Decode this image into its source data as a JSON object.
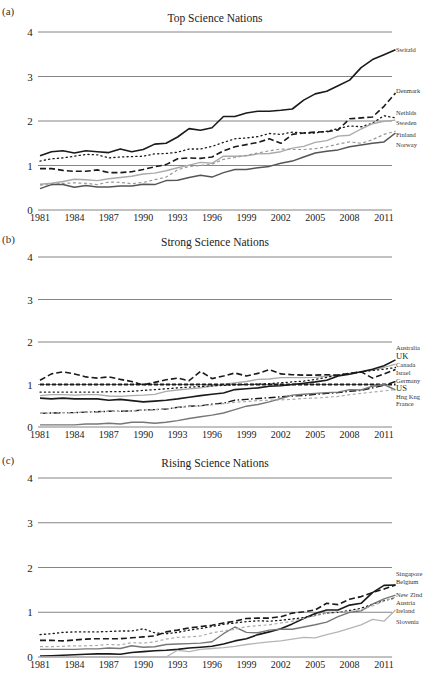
{
  "figure": {
    "panels": [
      {
        "id": "a",
        "label": "(a)",
        "title": "Top Science Nations"
      },
      {
        "id": "b",
        "label": "(b)",
        "title": "Strong Science Nations"
      },
      {
        "id": "c",
        "label": "(c)",
        "title": "Rising Science Nations"
      }
    ]
  },
  "chart_data": [
    {
      "type": "line",
      "panel_label": "(a)",
      "title": "Top Science Nations",
      "xlabel": "",
      "ylabel": "",
      "ylim": [
        0,
        4
      ],
      "yticks": [
        0,
        1,
        2,
        3,
        4
      ],
      "xticks": [
        "1981",
        "1984",
        "1987",
        "1990",
        "1993",
        "1996",
        "1999",
        "2002",
        "2005",
        "2008",
        "2011"
      ],
      "x": [
        1981,
        1982,
        1983,
        1984,
        1985,
        1986,
        1987,
        1988,
        1989,
        1990,
        1991,
        1992,
        1993,
        1994,
        1995,
        1996,
        1997,
        1998,
        1999,
        2000,
        2001,
        2002,
        2003,
        2004,
        2005,
        2006,
        2007,
        2008,
        2009,
        2010,
        2011,
        2012
      ],
      "grid": true,
      "legend": "inline-right",
      "series": [
        {
          "name": "Switzld",
          "style": "solid",
          "color": "#1a1a1a",
          "width": 1.6,
          "values": [
            1.22,
            1.31,
            1.33,
            1.28,
            1.33,
            1.31,
            1.29,
            1.37,
            1.31,
            1.36,
            1.48,
            1.5,
            1.64,
            1.83,
            1.79,
            1.85,
            2.1,
            2.1,
            2.18,
            2.22,
            2.22,
            2.24,
            2.27,
            2.47,
            2.61,
            2.67,
            2.79,
            2.92,
            3.2,
            3.38,
            3.49,
            3.6
          ]
        },
        {
          "name": "Denmark",
          "style": "dashed",
          "color": "#1a1a1a",
          "width": 1.6,
          "values": [
            0.93,
            0.93,
            0.89,
            0.87,
            0.87,
            0.9,
            0.84,
            0.84,
            0.86,
            0.91,
            0.97,
            1.02,
            1.15,
            1.17,
            1.16,
            1.19,
            1.33,
            1.42,
            1.47,
            1.52,
            1.6,
            1.5,
            1.7,
            1.73,
            1.75,
            1.76,
            1.8,
            2.05,
            2.07,
            2.09,
            2.33,
            2.63
          ]
        },
        {
          "name": "Nethlds",
          "style": "dotted",
          "color": "#1a1a1a",
          "width": 1.3,
          "values": [
            1.1,
            1.15,
            1.17,
            1.21,
            1.25,
            1.24,
            1.17,
            1.19,
            1.2,
            1.21,
            1.26,
            1.27,
            1.3,
            1.37,
            1.37,
            1.43,
            1.52,
            1.6,
            1.62,
            1.65,
            1.72,
            1.7,
            1.75,
            1.73,
            1.73,
            1.77,
            1.83,
            1.89,
            1.87,
            1.95,
            2.12,
            2.07
          ]
        },
        {
          "name": "Sweden",
          "style": "solid",
          "color": "#aaaaaa",
          "width": 1.4,
          "values": [
            0.58,
            0.6,
            0.64,
            0.69,
            0.68,
            0.66,
            0.7,
            0.73,
            0.76,
            0.81,
            0.83,
            0.88,
            0.95,
            1.01,
            1.07,
            1.05,
            1.21,
            1.21,
            1.22,
            1.26,
            1.27,
            1.31,
            1.39,
            1.43,
            1.52,
            1.56,
            1.66,
            1.68,
            1.82,
            1.94,
            1.99,
            2.02
          ]
        },
        {
          "name": "Finland",
          "style": "dashed-fine",
          "color": "#999999",
          "width": 1.2,
          "values": [
            0.56,
            0.57,
            0.6,
            0.61,
            0.6,
            0.57,
            0.63,
            0.62,
            0.59,
            0.62,
            0.68,
            0.74,
            0.9,
            0.98,
            1.0,
            1.03,
            1.14,
            1.18,
            1.23,
            1.28,
            1.33,
            1.37,
            1.36,
            1.36,
            1.38,
            1.42,
            1.48,
            1.53,
            1.5,
            1.58,
            1.7,
            1.77
          ]
        },
        {
          "name": "Norway",
          "style": "solid",
          "color": "#555555",
          "width": 1.5,
          "values": [
            0.48,
            0.57,
            0.57,
            0.51,
            0.55,
            0.52,
            0.52,
            0.54,
            0.54,
            0.58,
            0.57,
            0.66,
            0.67,
            0.73,
            0.78,
            0.74,
            0.84,
            0.91,
            0.91,
            0.95,
            0.98,
            1.05,
            1.1,
            1.19,
            1.28,
            1.32,
            1.35,
            1.42,
            1.46,
            1.5,
            1.53,
            1.73
          ]
        }
      ]
    },
    {
      "type": "line",
      "panel_label": "(b)",
      "title": "Strong Science Nations",
      "xlabel": "",
      "ylabel": "",
      "ylim": [
        0,
        4
      ],
      "yticks": [
        0,
        1,
        2,
        3,
        4
      ],
      "xticks": [
        "1981",
        "1984",
        "1987",
        "1990",
        "1993",
        "1996",
        "1999",
        "2002",
        "2005",
        "2008",
        "2011"
      ],
      "x": [
        1981,
        1982,
        1983,
        1984,
        1985,
        1986,
        1987,
        1988,
        1989,
        1990,
        1991,
        1992,
        1993,
        1994,
        1995,
        1996,
        1997,
        1998,
        1999,
        2000,
        2001,
        2002,
        2003,
        2004,
        2005,
        2006,
        2007,
        2008,
        2009,
        2010,
        2011,
        2012
      ],
      "grid": true,
      "legend": "inline-right",
      "series": [
        {
          "name": "Australia",
          "style": "solid",
          "color": "#aaaaaa",
          "width": 1.3,
          "values": [
            0.74,
            0.76,
            0.76,
            0.75,
            0.76,
            0.76,
            0.73,
            0.72,
            0.74,
            0.75,
            0.77,
            0.84,
            0.87,
            0.9,
            0.92,
            0.96,
            1.0,
            1.04,
            1.07,
            1.12,
            1.13,
            1.16,
            1.16,
            1.16,
            1.17,
            1.2,
            1.22,
            1.26,
            1.3,
            1.34,
            1.4,
            1.48
          ]
        },
        {
          "name": "UK",
          "style": "solid",
          "color": "#1a1a1a",
          "width": 1.6,
          "values": [
            0.68,
            0.66,
            0.68,
            0.66,
            0.66,
            0.66,
            0.63,
            0.65,
            0.62,
            0.59,
            0.61,
            0.63,
            0.66,
            0.7,
            0.74,
            0.77,
            0.8,
            0.88,
            0.9,
            0.92,
            0.96,
            0.97,
            1.0,
            1.03,
            1.06,
            1.1,
            1.2,
            1.24,
            1.3,
            1.36,
            1.44,
            1.58
          ]
        },
        {
          "name": "Canada",
          "style": "dotted",
          "color": "#1a1a1a",
          "width": 1.3,
          "values": [
            0.82,
            0.82,
            0.82,
            0.82,
            0.82,
            0.82,
            0.83,
            0.83,
            0.84,
            0.86,
            0.88,
            0.9,
            0.92,
            0.94,
            0.95,
            0.97,
            0.98,
            0.99,
            1.0,
            1.01,
            1.02,
            1.04,
            1.06,
            1.08,
            1.12,
            1.17,
            1.22,
            1.26,
            1.3,
            1.33,
            1.36,
            1.4
          ]
        },
        {
          "name": "Israel",
          "style": "dashed",
          "color": "#1a1a1a",
          "width": 1.6,
          "values": [
            1.1,
            1.25,
            1.3,
            1.25,
            1.18,
            1.15,
            1.18,
            1.12,
            1.07,
            0.99,
            1.05,
            1.11,
            1.15,
            1.09,
            1.31,
            1.14,
            1.2,
            1.27,
            1.2,
            1.26,
            1.35,
            1.25,
            1.23,
            1.22,
            1.22,
            1.23,
            1.22,
            1.26,
            1.3,
            1.15,
            1.25,
            1.35
          ]
        },
        {
          "name": "Germany",
          "style": "dashdot",
          "color": "#1a1a1a",
          "width": 1.4,
          "values": [
            0.32,
            0.33,
            0.34,
            0.34,
            0.35,
            0.36,
            0.37,
            0.37,
            0.38,
            0.4,
            0.41,
            0.42,
            0.46,
            0.49,
            0.5,
            0.54,
            0.56,
            0.63,
            0.65,
            0.67,
            0.69,
            0.71,
            0.73,
            0.74,
            0.77,
            0.79,
            0.81,
            0.84,
            0.86,
            0.92,
            0.98,
            1.07
          ]
        },
        {
          "name": "US",
          "style": "dashed-short",
          "color": "#1a1a1a",
          "width": 1.8,
          "values": [
            1.0,
            1.0,
            1.0,
            1.0,
            1.0,
            1.0,
            1.0,
            1.0,
            1.0,
            1.0,
            1.0,
            1.0,
            1.0,
            1.0,
            1.0,
            1.0,
            1.0,
            1.0,
            1.0,
            1.0,
            1.0,
            1.0,
            1.0,
            1.0,
            1.0,
            1.0,
            1.0,
            1.0,
            1.0,
            1.0,
            1.0,
            1.0
          ]
        },
        {
          "name": "Hng Kng",
          "style": "solid",
          "color": "#777777",
          "width": 1.4,
          "values": [
            0.05,
            0.05,
            0.05,
            0.05,
            0.07,
            0.07,
            0.09,
            0.07,
            0.11,
            0.11,
            0.09,
            0.11,
            0.15,
            0.2,
            0.24,
            0.28,
            0.33,
            0.41,
            0.49,
            0.53,
            0.59,
            0.67,
            0.75,
            0.77,
            0.79,
            0.81,
            0.82,
            0.88,
            0.87,
            0.96,
            1.0,
            0.87
          ]
        },
        {
          "name": "France",
          "style": "dashed-fine",
          "color": "#aaaaaa",
          "width": 1.2,
          "values": [
            0.32,
            0.33,
            0.34,
            0.34,
            0.35,
            0.36,
            0.37,
            0.37,
            0.38,
            0.4,
            0.41,
            0.42,
            0.46,
            0.48,
            0.5,
            0.52,
            0.55,
            0.58,
            0.6,
            0.62,
            0.63,
            0.64,
            0.65,
            0.67,
            0.68,
            0.7,
            0.72,
            0.76,
            0.79,
            0.82,
            0.85,
            0.88
          ]
        }
      ]
    },
    {
      "type": "line",
      "panel_label": "(c)",
      "title": "Rising Science Nations",
      "xlabel": "",
      "ylabel": "",
      "ylim": [
        0,
        4
      ],
      "yticks": [
        0,
        1,
        2,
        3,
        4
      ],
      "xticks": [
        "1981",
        "1984",
        "1987",
        "1990",
        "1993",
        "1996",
        "1999",
        "2002",
        "2005",
        "2008",
        "2011"
      ],
      "x": [
        1981,
        1982,
        1983,
        1984,
        1985,
        1986,
        1987,
        1988,
        1989,
        1990,
        1991,
        1992,
        1993,
        1994,
        1995,
        1996,
        1997,
        1998,
        1999,
        2000,
        2001,
        2002,
        2003,
        2004,
        2005,
        2006,
        2007,
        2008,
        2009,
        2010,
        2011,
        2012
      ],
      "grid": true,
      "legend": "inline-right",
      "series": [
        {
          "name": "Singapore",
          "style": "solid",
          "color": "#1a1a1a",
          "width": 1.6,
          "values": [
            0.02,
            0.03,
            0.04,
            0.05,
            0.06,
            0.07,
            0.07,
            0.06,
            0.1,
            0.12,
            0.14,
            0.15,
            0.17,
            0.2,
            0.22,
            0.24,
            0.29,
            0.36,
            0.41,
            0.5,
            0.56,
            0.63,
            0.74,
            0.86,
            0.97,
            1.05,
            1.05,
            1.16,
            1.2,
            1.44,
            1.6,
            1.61
          ]
        },
        {
          "name": "Belgium",
          "style": "dashed",
          "color": "#1a1a1a",
          "width": 1.6,
          "values": [
            0.37,
            0.37,
            0.36,
            0.38,
            0.4,
            0.41,
            0.41,
            0.41,
            0.43,
            0.45,
            0.47,
            0.56,
            0.6,
            0.65,
            0.68,
            0.71,
            0.76,
            0.8,
            0.86,
            0.87,
            0.87,
            0.9,
            0.98,
            1.01,
            1.05,
            1.2,
            1.17,
            1.29,
            1.35,
            1.44,
            1.52,
            1.61
          ]
        },
        {
          "name": "New Zlnd",
          "style": "dotted",
          "color": "#1a1a1a",
          "width": 1.3,
          "values": [
            0.5,
            0.52,
            0.55,
            0.56,
            0.56,
            0.56,
            0.57,
            0.58,
            0.58,
            0.63,
            0.54,
            0.52,
            0.55,
            0.6,
            0.64,
            0.68,
            0.73,
            0.76,
            0.79,
            0.81,
            0.8,
            0.82,
            0.85,
            0.88,
            0.94,
            0.98,
            1.0,
            1.04,
            1.09,
            1.18,
            1.26,
            1.32
          ]
        },
        {
          "name": "Austria",
          "style": "solid",
          "color": "#777777",
          "width": 1.4,
          "values": [
            0.17,
            0.17,
            0.17,
            0.17,
            0.18,
            0.18,
            0.2,
            0.19,
            0.25,
            0.22,
            0.23,
            0.28,
            0.29,
            0.3,
            0.31,
            0.34,
            0.52,
            0.67,
            0.55,
            0.54,
            0.6,
            0.62,
            0.62,
            0.67,
            0.72,
            0.78,
            0.9,
            1.0,
            1.03,
            1.18,
            1.3,
            1.38
          ]
        },
        {
          "name": "Ireland",
          "style": "dashed-fine",
          "color": "#aaaaaa",
          "width": 1.2,
          "values": [
            0.23,
            0.23,
            0.24,
            0.25,
            0.25,
            0.26,
            0.28,
            0.27,
            0.32,
            0.31,
            0.34,
            0.4,
            0.44,
            0.45,
            0.47,
            0.54,
            0.58,
            0.62,
            0.68,
            0.7,
            0.72,
            0.76,
            0.8,
            0.86,
            0.92,
            0.98,
            1.0,
            1.02,
            1.06,
            1.14,
            1.25,
            1.34
          ]
        },
        {
          "name": "Slovenia",
          "style": "solid",
          "color": "#b5b5b5",
          "width": 1.3,
          "values": [
            0.0,
            0.0,
            0.0,
            0.0,
            0.0,
            0.0,
            0.0,
            0.0,
            0.0,
            0.0,
            0.0,
            0.0,
            0.15,
            0.12,
            0.17,
            0.19,
            0.21,
            0.24,
            0.28,
            0.31,
            0.34,
            0.36,
            0.4,
            0.44,
            0.43,
            0.5,
            0.56,
            0.64,
            0.72,
            0.84,
            0.8,
            1.05
          ]
        }
      ]
    }
  ]
}
